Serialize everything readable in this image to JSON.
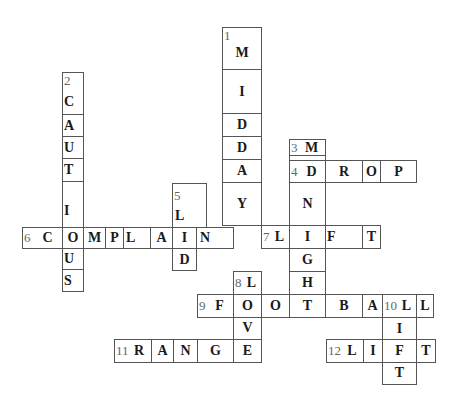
{
  "puzzle": {
    "title": "Crossword",
    "clues": [
      {
        "number": "1",
        "direction": "down",
        "answer": "MIDDAY"
      },
      {
        "number": "2",
        "direction": "down",
        "answer": "CAUTIOUS"
      },
      {
        "number": "3",
        "direction": "down",
        "answer": "MIDNIGHT"
      },
      {
        "number": "4",
        "direction": "across",
        "answer": "DROP"
      },
      {
        "number": "5",
        "direction": "down",
        "answer": "LID"
      },
      {
        "number": "6",
        "direction": "across",
        "answer": "COMPLAIN"
      },
      {
        "number": "7",
        "direction": "across",
        "answer": "LIFT"
      },
      {
        "number": "8",
        "direction": "down",
        "answer": "LOVE"
      },
      {
        "number": "9",
        "direction": "across",
        "answer": "FOOTBALL"
      },
      {
        "number": "10",
        "direction": "down",
        "answer": "LIFT"
      },
      {
        "number": "11",
        "direction": "across",
        "answer": "RANGE"
      },
      {
        "number": "12",
        "direction": "across",
        "answer": "LIFT"
      }
    ]
  },
  "cells": {
    "c1_0": {
      "num": "1",
      "ch": "M"
    },
    "c1_1": {
      "ch": "I"
    },
    "c1_2": {
      "ch": "D"
    },
    "c1_3": {
      "ch": "D"
    },
    "c1_4": {
      "ch": "A"
    },
    "c1_5": {
      "ch": "Y"
    },
    "c2_0": {
      "num": "2",
      "ch": "C"
    },
    "c2_1": {
      "ch": "A"
    },
    "c2_2": {
      "ch": "U"
    },
    "c2_3": {
      "ch": "T"
    },
    "c2_4": {
      "ch": "I"
    },
    "c2_5": {
      "ch": "O"
    },
    "c2_6": {
      "ch": "U"
    },
    "c2_7": {
      "ch": "S"
    },
    "c3_0": {
      "num": "3",
      "ch": "M"
    },
    "c3_1": {
      "ch": "I"
    },
    "c3_2": {
      "num": "4",
      "ch": "D"
    },
    "c3_3": {
      "ch": "N"
    },
    "c3_4": {
      "ch": "I"
    },
    "c3_5": {
      "ch": "G"
    },
    "c3_6": {
      "ch": "H"
    },
    "c3_7": {
      "ch": "T"
    },
    "r4_1": {
      "ch": "R"
    },
    "r4_2": {
      "ch": "O"
    },
    "r4_3": {
      "ch": "P"
    },
    "c5_0": {
      "num": "5",
      "ch": "L"
    },
    "c5_1": {
      "ch": "I"
    },
    "c5_2": {
      "ch": "D"
    },
    "r6_0": {
      "num": "6",
      "ch": "C"
    },
    "r6_2": {
      "ch": "M"
    },
    "r6_3": {
      "ch": "P"
    },
    "r6_4": {
      "ch": "L"
    },
    "r6_5": {
      "ch": "A"
    },
    "r6_7": {
      "ch": "N"
    },
    "r7_0": {
      "num": "7",
      "ch": "L"
    },
    "r7_2": {
      "ch": "F"
    },
    "r7_3": {
      "ch": "T"
    },
    "c8_0": {
      "num": "8",
      "ch": "L"
    },
    "c8_2": {
      "ch": "V"
    },
    "c8_3": {
      "ch": "E"
    },
    "r9_0": {
      "num": "9",
      "ch": "F"
    },
    "r9_1": {
      "ch": "O"
    },
    "r9_2": {
      "ch": "O"
    },
    "r9_3": {
      "ch": "T"
    },
    "r9_4": {
      "ch": "B"
    },
    "r9_5": {
      "ch": "A"
    },
    "r9_6": {
      "num": "10",
      "ch": "L"
    },
    "r9_7": {
      "ch": "L"
    },
    "c10_1": {
      "ch": "I"
    },
    "c10_3": {
      "ch": "T"
    },
    "r11_0": {
      "num": "11",
      "ch": "R"
    },
    "r11_1": {
      "ch": "A"
    },
    "r11_2": {
      "ch": "N"
    },
    "r11_3": {
      "ch": "G"
    },
    "r12_0": {
      "num": "12",
      "ch": "L"
    },
    "r12_1": {
      "ch": "I"
    },
    "r12_2": {
      "ch": "F"
    },
    "r12_3": {
      "ch": "T"
    }
  }
}
